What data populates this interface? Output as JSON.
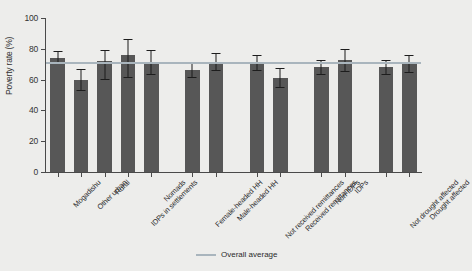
{
  "chart_data": {
    "type": "bar",
    "title": "",
    "xlabel": "",
    "ylabel": "Poverty rate (%)",
    "ylim": [
      0,
      100
    ],
    "yticks": [
      0,
      20,
      40,
      60,
      80,
      100
    ],
    "grid": false,
    "legend_position": "bottom-right",
    "categories": [
      "Mogadishu",
      "Other urban",
      "Rural",
      "IDPs in settlements",
      "Nomads",
      "Female-headed HH",
      "Male-headed HH",
      "Not received remittances",
      "Received remittances",
      "Non-IDPs",
      "IDPs",
      "Not drought affected",
      "Drought affected"
    ],
    "values": [
      74,
      60,
      72,
      76,
      71.5,
      66,
      71.5,
      71,
      61,
      68,
      72.5,
      68,
      70.5
    ],
    "error_low": [
      70.5,
      53.5,
      60.5,
      62,
      63.5,
      61.5,
      66,
      66,
      55.5,
      63.5,
      65.5,
      63.5,
      65
    ],
    "error_high": [
      78.5,
      67,
      79,
      86.5,
      79,
      71,
      77,
      76,
      67.5,
      73,
      80,
      73,
      76
    ],
    "annotations": [
      {
        "name": "overall-average",
        "value": 71,
        "label": "Overall average",
        "color": "#a9b5bd"
      }
    ],
    "series": [
      {
        "name": "Poverty rate",
        "color": "#575757"
      }
    ],
    "group_breaks": [
      5,
      7,
      9,
      11
    ]
  },
  "legend": {
    "average_label": "Overall average"
  },
  "colors": {
    "bar": "#575757",
    "average_line": "#a9b5bd",
    "background": "#ededeb",
    "axis": "#4a4a4a",
    "error_bar": "#1d1d1d"
  }
}
